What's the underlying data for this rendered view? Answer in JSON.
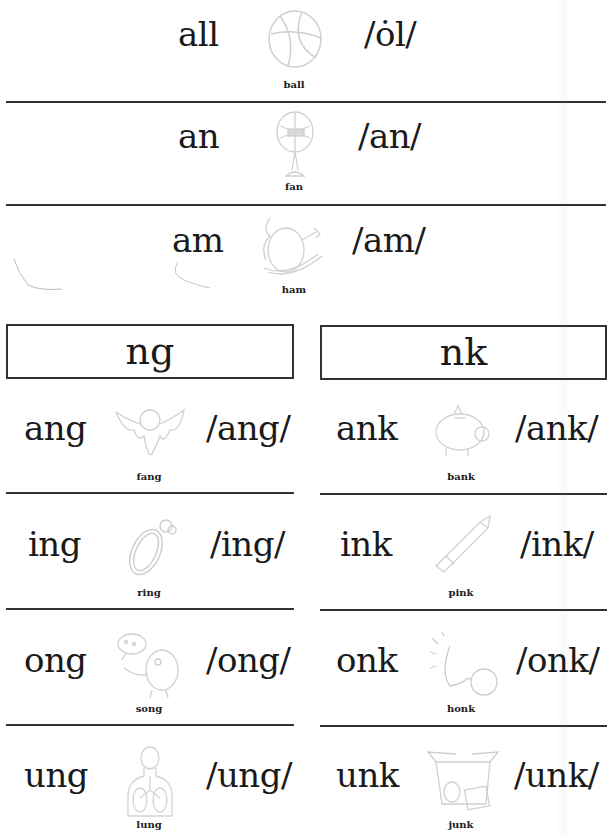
{
  "top_rows": [
    {
      "pattern": "all",
      "pronunciation": "/ȯl/",
      "picture": "basketball-icon",
      "word": "ball"
    },
    {
      "pattern": "an",
      "pronunciation": "/an/",
      "picture": "fan-icon",
      "word": "fan"
    },
    {
      "pattern": "am",
      "pronunciation": "/am/",
      "picture": "ham-icon",
      "word": "ham"
    }
  ],
  "sections": [
    {
      "header": "ng",
      "rows": [
        {
          "pattern": "ang",
          "pronunciation": "/ang/",
          "picture": "bat-fang-icon",
          "word": "fang"
        },
        {
          "pattern": "ing",
          "pronunciation": "/ing/",
          "picture": "ring-icon",
          "word": "ring"
        },
        {
          "pattern": "ong",
          "pronunciation": "/ong/",
          "picture": "singing-bird-icon",
          "word": "song"
        },
        {
          "pattern": "ung",
          "pronunciation": "/ung/",
          "picture": "lungs-icon",
          "word": "lung"
        }
      ]
    },
    {
      "header": "nk",
      "rows": [
        {
          "pattern": "ank",
          "pronunciation": "/ank/",
          "picture": "piggy-bank-icon",
          "word": "bank"
        },
        {
          "pattern": "ink",
          "pronunciation": "/ink/",
          "picture": "marker-icon",
          "word": "pink"
        },
        {
          "pattern": "onk",
          "pronunciation": "/onk/",
          "picture": "horn-icon",
          "word": "honk"
        },
        {
          "pattern": "unk",
          "pronunciation": "/unk/",
          "picture": "junk-box-icon",
          "word": "junk"
        }
      ]
    }
  ],
  "colors": {
    "text": "#1a1a1a",
    "rule": "#333333",
    "picture_stroke": "#cfcfcf"
  }
}
